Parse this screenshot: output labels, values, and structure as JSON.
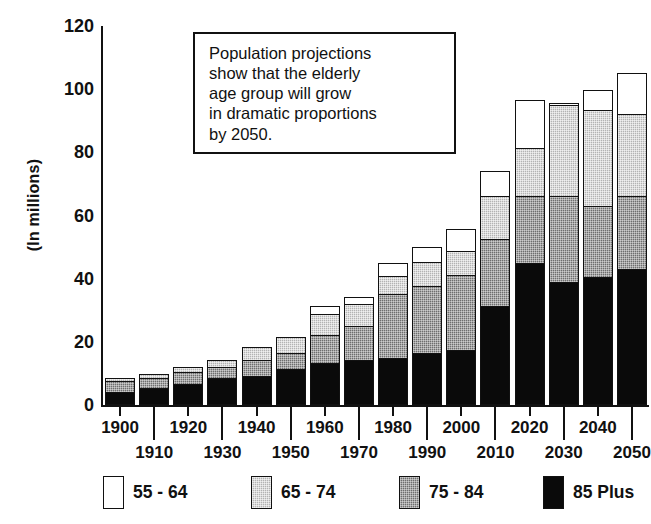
{
  "annotation": {
    "text": "Population projections\nshow that the elderly\nage group will grow\nin dramatic proportions\nby 2050."
  },
  "chart_data": {
    "type": "bar",
    "subtype": "stacked-vertical",
    "title": "",
    "xlabel": "",
    "ylabel": "(In millions)",
    "ylim": [
      0,
      120
    ],
    "yticks": [
      0,
      20,
      40,
      60,
      80,
      100,
      120
    ],
    "ytick_labels": [
      "0",
      "20",
      "40",
      "60",
      "80",
      "100",
      "120"
    ],
    "grid": false,
    "legend_position": "bottom",
    "categories": [
      "1900",
      "1910",
      "1920",
      "1930",
      "1940",
      "1950",
      "1960",
      "1970",
      "1980",
      "1990",
      "2000",
      "2010",
      "2020",
      "2030",
      "2040",
      "2050"
    ],
    "series": [
      {
        "name": "85 Plus",
        "color": "#0a0a0a",
        "values": [
          4.2,
          5.3,
          6.5,
          8.4,
          9.3,
          11.4,
          13.3,
          14.3,
          15.0,
          16.5,
          17.5,
          31.5,
          45.0,
          39.0,
          40.4,
          43.2
        ]
      },
      {
        "name": "75 - 84",
        "color": "#6e6e6e",
        "values": [
          3.9,
          3.7,
          4.4,
          4.3,
          5.5,
          5.5,
          9.3,
          11.3,
          20.6,
          21.6,
          24.3,
          21.6,
          21.7,
          27.6,
          23.2,
          23.5
        ]
      },
      {
        "name": "65 - 74",
        "color": "#b3b3b3",
        "values": [
          1.6,
          1.8,
          2.3,
          2.5,
          4.6,
          5.5,
          7.3,
          7.3,
          6.4,
          8.2,
          8.1,
          14.1,
          15.8,
          29.4,
          30.8,
          26.3
        ]
      },
      {
        "name": "55 - 64",
        "color": "#ffffff",
        "values": [
          0.0,
          0.0,
          0.0,
          0.0,
          0.0,
          0.0,
          3.1,
          2.9,
          4.6,
          5.2,
          7.2,
          8.3,
          15.5,
          1.3,
          6.9,
          13.6
        ]
      }
    ],
    "totals": [
      9.7,
      10.8,
      13.2,
      15.2,
      19.4,
      22.4,
      33.0,
      35.8,
      46.6,
      51.5,
      57.1,
      75.5,
      98.0,
      97.3,
      101.3,
      106.6
    ]
  },
  "legend": {
    "items": [
      {
        "label": "55 - 64",
        "swatch": "white"
      },
      {
        "label": "65 - 74",
        "swatch": "light-gray"
      },
      {
        "label": "75 - 84",
        "swatch": "dark-gray"
      },
      {
        "label": "85 Plus",
        "swatch": "black"
      }
    ]
  }
}
